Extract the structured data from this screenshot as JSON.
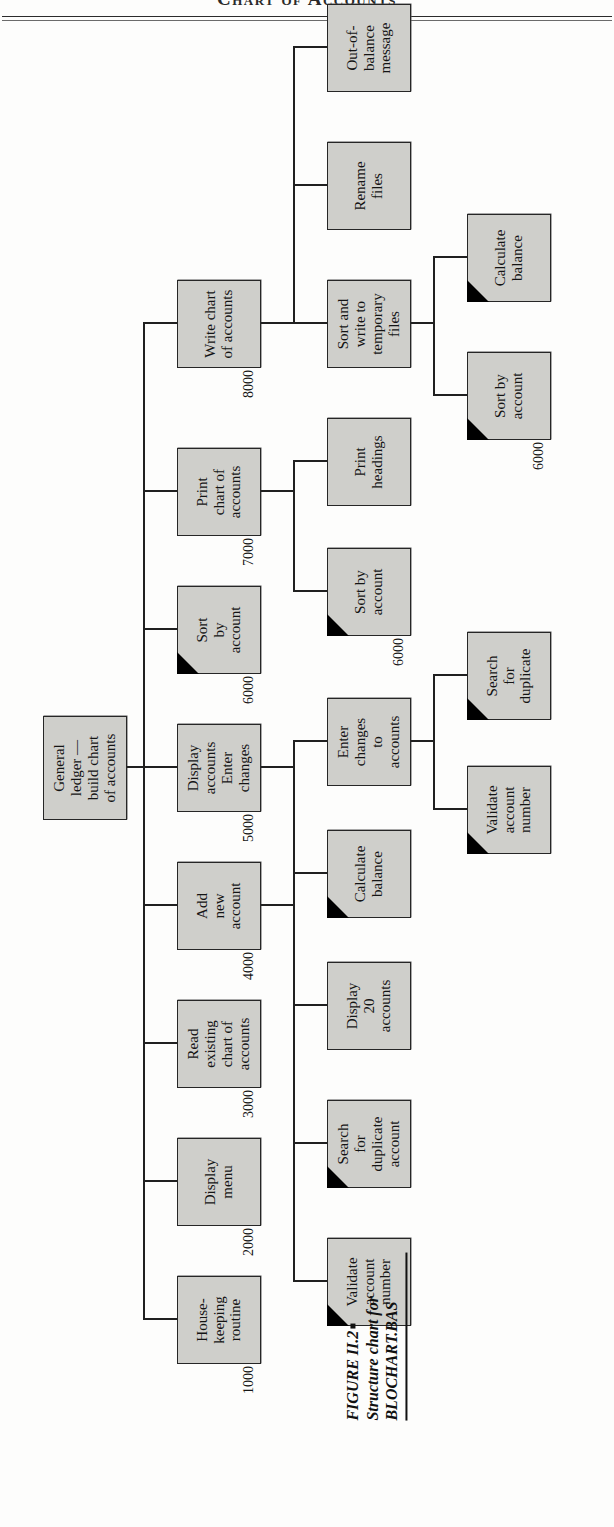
{
  "page": {
    "running_head": "Chart of Accounts"
  },
  "caption": {
    "figure_number": "FIGURE II.2",
    "line2": "Structure chart for",
    "line3": "BLOCHART.BAS"
  },
  "chart_data": {
    "type": "diagram",
    "title": "Structure chart for BLOCHART.BAS",
    "root": {
      "id": "root",
      "label": "General\nledger —\nbuild chart\nof accounts",
      "ref": "",
      "predefined": false
    },
    "level1": [
      {
        "id": "n1000",
        "label": "House-\nkeeping\nroutine",
        "ref": "1000",
        "predefined": false
      },
      {
        "id": "n2000",
        "label": "Display\nmenu",
        "ref": "2000",
        "predefined": false
      },
      {
        "id": "n3000",
        "label": "Read\nexisting\nchart of\naccounts",
        "ref": "3000",
        "predefined": false
      },
      {
        "id": "n4000",
        "label": "Add\nnew\naccount",
        "ref": "4000",
        "predefined": false
      },
      {
        "id": "n5000",
        "label": "Display\naccounts\nEnter\nchanges",
        "ref": "5000",
        "predefined": false
      },
      {
        "id": "n6000",
        "label": "Sort\nby\naccount",
        "ref": "6000",
        "predefined": true
      },
      {
        "id": "n7000",
        "label": "Print\nchart of\naccounts",
        "ref": "7000",
        "predefined": false
      },
      {
        "id": "n8000",
        "label": "Write chart\nof accounts",
        "ref": "8000",
        "predefined": false
      }
    ],
    "level2": [
      {
        "id": "validate1",
        "label": "Validate\naccount\nnumber",
        "ref": "",
        "predefined": true,
        "parent": "n4000"
      },
      {
        "id": "searchdup1",
        "label": "Search\nfor\nduplicate\naccount",
        "ref": "",
        "predefined": true,
        "parent": "n4000"
      },
      {
        "id": "display20",
        "label": "Display\n20\naccounts",
        "ref": "",
        "predefined": false,
        "parent": "n5000"
      },
      {
        "id": "calcbal1",
        "label": "Calculate\nbalance",
        "ref": "",
        "predefined": true,
        "parent": "n5000"
      },
      {
        "id": "enterchg",
        "label": "Enter\nchanges\nto\naccounts",
        "ref": "",
        "predefined": false,
        "parent": "n5000"
      },
      {
        "id": "sortacct1",
        "label": "Sort by\naccount",
        "ref": "6000",
        "predefined": true,
        "parent": "n7000"
      },
      {
        "id": "printhead",
        "label": "Print\nheadings",
        "ref": "",
        "predefined": false,
        "parent": "n7000"
      },
      {
        "id": "sortwrite",
        "label": "Sort and\nwrite to\ntemporary\nfiles",
        "ref": "",
        "predefined": false,
        "parent": "n8000"
      },
      {
        "id": "rename",
        "label": "Rename\nfiles",
        "ref": "",
        "predefined": false,
        "parent": "n8000"
      },
      {
        "id": "outofbal",
        "label": "Out-of-\nbalance\nmessage",
        "ref": "",
        "predefined": false,
        "parent": "n8000"
      }
    ],
    "level3": [
      {
        "id": "validate2",
        "label": "Validate\naccount\nnumber",
        "ref": "",
        "predefined": true,
        "parent": "enterchg"
      },
      {
        "id": "searchdup2",
        "label": "Search\nfor\nduplicate",
        "ref": "",
        "predefined": true,
        "parent": "enterchg"
      },
      {
        "id": "sortacct2",
        "label": "Sort by\naccount",
        "ref": "6000",
        "predefined": true,
        "parent": "sortwrite"
      },
      {
        "id": "calcbal2",
        "label": "Calculate\nbalance",
        "ref": "",
        "predefined": true,
        "parent": "sortwrite"
      }
    ],
    "legend": {
      "predefined_marker": "black-corner-triangle = previously defined module"
    }
  }
}
